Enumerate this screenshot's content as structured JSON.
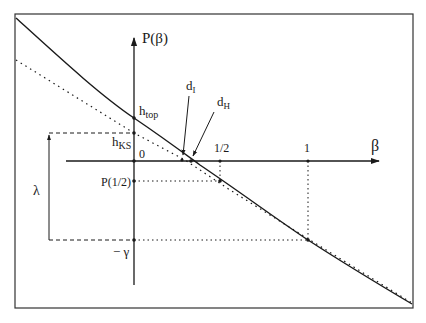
{
  "diagram": {
    "colors": {
      "ink": "#1a1a1a",
      "background": "#ffffff"
    },
    "axes": {
      "y_label": "P(β)",
      "x_label": "β",
      "x_ticks": [
        {
          "label": "0"
        },
        {
          "label": "1/2"
        },
        {
          "label": "1"
        }
      ]
    },
    "y_labels": {
      "h_top": {
        "main": "h",
        "sub": "top"
      },
      "h_ks": {
        "main": "h",
        "sub": "KS"
      },
      "p_half": "P(1/2)",
      "minus_gamma": "− γ"
    },
    "annotations": {
      "lambda": "λ",
      "d_i": {
        "main": "d",
        "sub": "I"
      },
      "d_h": {
        "main": "d",
        "sub": "H"
      }
    },
    "curves": [
      {
        "name": "pressure-curve",
        "style": "solid"
      },
      {
        "name": "tangent-line",
        "style": "dotted"
      }
    ]
  }
}
